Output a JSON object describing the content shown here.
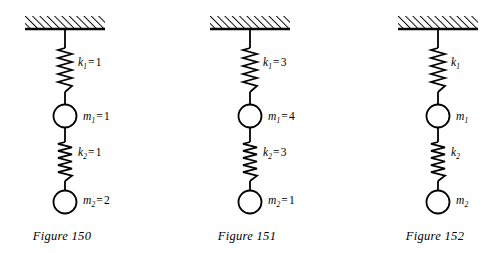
{
  "page": {
    "background": "#ffffff",
    "ink": "#000000",
    "width": 499,
    "height": 253
  },
  "figures": [
    {
      "caption": "Figure 150",
      "axis_x": 83,
      "labels": {
        "k1": {
          "symbol": "k",
          "subscript": "1",
          "equals": "=",
          "value": "1",
          "show_value": true
        },
        "m1": {
          "symbol": "m",
          "subscript": "1",
          "equals": "=",
          "value": "1",
          "show_value": true
        },
        "k2": {
          "symbol": "k",
          "subscript": "2",
          "equals": "=",
          "value": "1",
          "show_value": true
        },
        "m2": {
          "symbol": "m",
          "subscript": "2",
          "equals": "=",
          "value": "2",
          "show_value": true
        }
      },
      "spring_constants": [
        1,
        1
      ],
      "masses": [
        1,
        2
      ]
    },
    {
      "caption": "Figure 151",
      "axis_x": 83,
      "labels": {
        "k1": {
          "symbol": "k",
          "subscript": "1",
          "equals": "=",
          "value": "3",
          "show_value": true
        },
        "m1": {
          "symbol": "m",
          "subscript": "1",
          "equals": "=",
          "value": "4",
          "show_value": true
        },
        "k2": {
          "symbol": "k",
          "subscript": "2",
          "equals": "=",
          "value": "3",
          "show_value": true
        },
        "m2": {
          "symbol": "m",
          "subscript": "2",
          "equals": "=",
          "value": "1",
          "show_value": true
        }
      },
      "spring_constants": [
        3,
        3
      ],
      "masses": [
        4,
        1
      ]
    },
    {
      "caption": "Figure 152",
      "axis_x": 83,
      "labels": {
        "k1": {
          "symbol": "k",
          "subscript": "1",
          "equals": "",
          "value": "",
          "show_value": false
        },
        "m1": {
          "symbol": "m",
          "subscript": "1",
          "equals": "",
          "value": "",
          "show_value": false
        },
        "k2": {
          "symbol": "k",
          "subscript": "2",
          "equals": "",
          "value": "",
          "show_value": false
        },
        "m2": {
          "symbol": "m",
          "subscript": "2",
          "equals": "",
          "value": "",
          "show_value": false
        }
      },
      "spring_constants": [
        null,
        null
      ],
      "masses": [
        null,
        null
      ]
    }
  ],
  "diagram_geometry": {
    "ceiling": {
      "left": 46,
      "right": 126,
      "top": 16,
      "bottom": 29,
      "hatch_angle_deg": 45
    },
    "rod_segments": [
      [
        29,
        48
      ],
      [
        92,
        104
      ],
      [
        126,
        142
      ],
      [
        181,
        190
      ]
    ],
    "springs": [
      {
        "top": 48,
        "bottom": 92,
        "coils": 5,
        "amplitude": 7
      },
      {
        "top": 142,
        "bottom": 181,
        "coils": 5,
        "amplitude": 7
      }
    ],
    "masses": [
      {
        "cy": 116,
        "r": 11.5
      },
      {
        "cy": 202,
        "r": 11.5
      }
    ],
    "stroke_width": 1.8
  }
}
